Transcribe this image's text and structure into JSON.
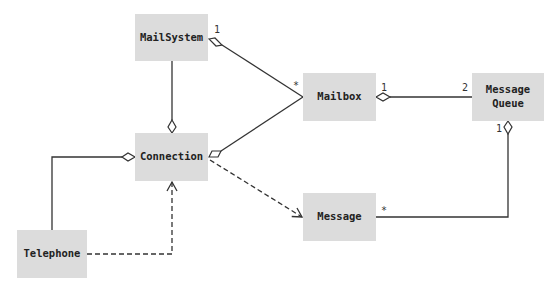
{
  "diagram": {
    "type": "UML class diagram",
    "classes": {
      "mailsystem": "MailSystem",
      "connection": "Connection",
      "mailbox": "Mailbox",
      "messagequeue": "Message\nQueue",
      "message": "Message",
      "telephone": "Telephone"
    },
    "multiplicities": {
      "mailsystem_mailbox_src": "1",
      "mailsystem_mailbox_dst": "*",
      "mailbox_queue_src": "1",
      "mailbox_queue_dst": "2",
      "queue_message_src": "1",
      "queue_message_dst": "*"
    },
    "relationships": [
      {
        "from": "MailSystem",
        "to": "Mailbox",
        "kind": "aggregation",
        "from_mult": "1",
        "to_mult": "*"
      },
      {
        "from": "Connection",
        "to": "MailSystem",
        "kind": "aggregation"
      },
      {
        "from": "Connection",
        "to": "Mailbox",
        "kind": "aggregation"
      },
      {
        "from": "Mailbox",
        "to": "Message Queue",
        "kind": "aggregation",
        "from_mult": "1",
        "to_mult": "2"
      },
      {
        "from": "Message Queue",
        "to": "Message",
        "kind": "aggregation",
        "from_mult": "1",
        "to_mult": "*"
      },
      {
        "from": "Connection",
        "to": "Telephone",
        "kind": "aggregation"
      },
      {
        "from": "Connection",
        "to": "Message",
        "kind": "dependency"
      },
      {
        "from": "Telephone",
        "to": "Connection",
        "kind": "dependency"
      }
    ],
    "colors": {
      "box_fill": "#dcdcdc",
      "line": "#333333"
    }
  }
}
